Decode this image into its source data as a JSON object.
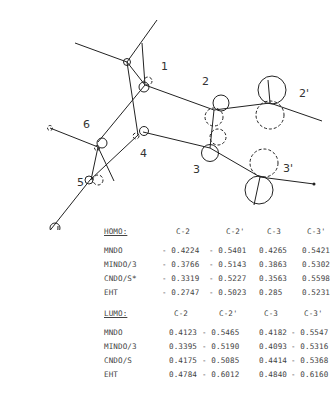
{
  "figure": {
    "atom_labels": {
      "a1": "1",
      "a2": "2",
      "a2p": "2'",
      "a3": "3",
      "a3p": "3'",
      "a4": "4",
      "a5": "5",
      "a6": "6"
    }
  },
  "homo": {
    "title": "HOMO:",
    "columns": [
      "C-2",
      "C-2'",
      "C-3",
      "C-3'"
    ],
    "rows": [
      {
        "method": "MNDO",
        "values": [
          "- 0.4224",
          "- 0.5401",
          "0.4265",
          "0.5421"
        ]
      },
      {
        "method": "MINDO/3",
        "values": [
          "- 0.3766",
          "- 0.5143",
          "0.3863",
          "0.5302"
        ]
      },
      {
        "method": "CNDO/S*",
        "values": [
          "- 0.3319",
          "- 0.5227",
          "0.3563",
          "0.5598"
        ]
      },
      {
        "method": "EHT",
        "values": [
          "- 0.2747",
          "- 0.5023",
          "0.285",
          "0.5231"
        ]
      }
    ]
  },
  "lumo": {
    "title": "LUMO:",
    "columns": [
      "C-2",
      "C-2'",
      "C-3",
      "C-3'"
    ],
    "rows": [
      {
        "method": "MNDO",
        "values": [
          "0.4123",
          "- 0.5465",
          "0.4182",
          "- 0.5547"
        ]
      },
      {
        "method": "MINDO/3",
        "values": [
          "0.3395",
          "- 0.5190",
          "0.4093",
          "- 0.5316"
        ]
      },
      {
        "method": "CNDO/S",
        "values": [
          "0.4175",
          "- 0.5085",
          "0.4414",
          "- 0.5368"
        ]
      },
      {
        "method": "EHT",
        "values": [
          "0.4784",
          "- 0.6012",
          "0.4840",
          "- 0.6160"
        ]
      }
    ]
  }
}
